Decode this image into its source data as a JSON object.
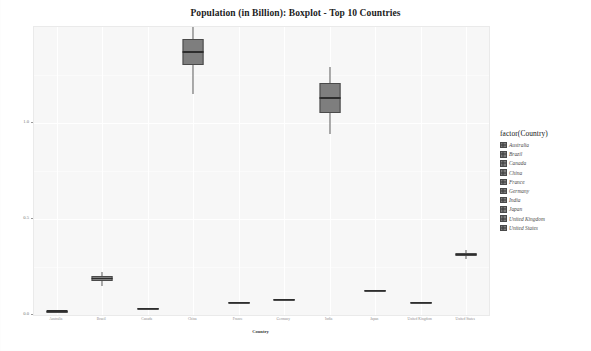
{
  "chart_data": {
    "type": "boxplot",
    "title": "Population (in Billion): Boxplot - Top 10 Countries",
    "xlabel": "Country",
    "ylabel": "Population (in Billion)",
    "legend_title": "factor(Country)",
    "legend_position": "right",
    "grid": true,
    "ylim": [
      0.0,
      1.5
    ],
    "yticks": [
      "0.0",
      "0.5",
      "1.0"
    ],
    "ytick_values": [
      0.0,
      0.5,
      1.0
    ],
    "categories": [
      "Australia",
      "Brazil",
      "Canada",
      "China",
      "France",
      "Germany",
      "India",
      "Japan",
      "United Kingdom",
      "United States"
    ],
    "boxes": [
      {
        "name": "Australia",
        "whisker_low": 0.017,
        "q1": 0.019,
        "median": 0.021,
        "q3": 0.023,
        "whisker_high": 0.025
      },
      {
        "name": "Brazil",
        "whisker_low": 0.15,
        "q1": 0.175,
        "median": 0.19,
        "q3": 0.205,
        "whisker_high": 0.225
      },
      {
        "name": "Canada",
        "whisker_low": 0.028,
        "q1": 0.031,
        "median": 0.033,
        "q3": 0.035,
        "whisker_high": 0.038
      },
      {
        "name": "China",
        "whisker_low": 1.15,
        "q1": 1.3,
        "median": 1.37,
        "q3": 1.44,
        "whisker_high": 1.5
      },
      {
        "name": "France",
        "whisker_low": 0.06,
        "q1": 0.062,
        "median": 0.064,
        "q3": 0.066,
        "whisker_high": 0.068
      },
      {
        "name": "Germany",
        "whisker_low": 0.078,
        "q1": 0.08,
        "median": 0.081,
        "q3": 0.083,
        "whisker_high": 0.085
      },
      {
        "name": "India",
        "whisker_low": 0.94,
        "q1": 1.05,
        "median": 1.13,
        "q3": 1.21,
        "whisker_high": 1.29
      },
      {
        "name": "Japan",
        "whisker_low": 0.123,
        "q1": 0.126,
        "median": 0.128,
        "q3": 0.13,
        "whisker_high": 0.133
      },
      {
        "name": "United Kingdom",
        "whisker_low": 0.06,
        "q1": 0.063,
        "median": 0.065,
        "q3": 0.067,
        "whisker_high": 0.07
      },
      {
        "name": "United States",
        "whisker_low": 0.29,
        "q1": 0.305,
        "median": 0.315,
        "q3": 0.325,
        "whisker_high": 0.34
      }
    ],
    "colors": {
      "box_fill": "#7e7e7e",
      "box_border": "#4a4a4a",
      "median": "#2e2e2e",
      "panel_bg": "#f7f7f7",
      "gridline": "#ffffff"
    }
  },
  "legend": {
    "title": "factor(Country)",
    "items": [
      {
        "label": "Australia"
      },
      {
        "label": "Brazil"
      },
      {
        "label": "Canada"
      },
      {
        "label": "China"
      },
      {
        "label": "France"
      },
      {
        "label": "Germany"
      },
      {
        "label": "India"
      },
      {
        "label": "Japan"
      },
      {
        "label": "United Kingdom"
      },
      {
        "label": "United States"
      }
    ]
  }
}
